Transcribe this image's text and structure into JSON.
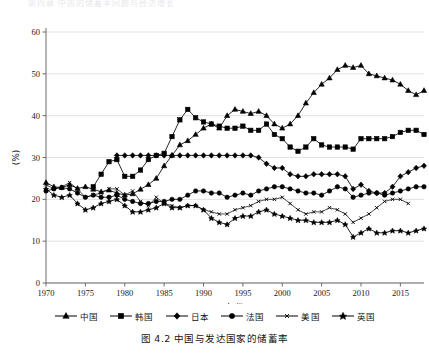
{
  "figure": {
    "cutoff_header": "第四章 中国的储蓄率问题与经济增长",
    "caption": "图 4.2  中国与发达国家的储蓄率"
  },
  "axes": {
    "y_label": "(%)",
    "x_label": "年份",
    "y_ticks": [
      0,
      10,
      20,
      30,
      40,
      50,
      60
    ],
    "y_tick_labels": [
      "0",
      "10",
      "20",
      "30",
      "40",
      "50",
      "60"
    ],
    "x_ticks": [
      1970,
      1975,
      1980,
      1985,
      1990,
      1995,
      2000,
      2005,
      2010,
      2015
    ],
    "x_tick_labels": [
      "1970",
      "1975",
      "1980",
      "1985",
      "1990",
      "1995",
      "2000",
      "2005",
      "2010",
      "2015"
    ]
  },
  "legend": {
    "position": "bottom",
    "items": [
      {
        "label": "中国",
        "marker": "triangle",
        "color": "#000000"
      },
      {
        "label": "韩国",
        "marker": "square",
        "color": "#000000"
      },
      {
        "label": "日本",
        "marker": "diamond",
        "color": "#000000"
      },
      {
        "label": "法国",
        "marker": "circle",
        "color": "#000000"
      },
      {
        "label": "美国",
        "marker": "cross",
        "color": "#000000"
      },
      {
        "label": "英国",
        "marker": "star",
        "color": "#000000"
      }
    ]
  },
  "chart_data": {
    "type": "line",
    "title": "图 4.2  中国与发达国家的储蓄率",
    "xlabel": "年份",
    "ylabel": "(%)",
    "xlim": [
      1970,
      2018
    ],
    "ylim": [
      0,
      60
    ],
    "grid": true,
    "legend_position": "bottom",
    "series": [
      {
        "name": "中国",
        "marker": "triangle",
        "x": [
          1970,
          1971,
          1972,
          1973,
          1974,
          1975,
          1976,
          1977,
          1978,
          1979,
          1980,
          1981,
          1982,
          1983,
          1984,
          1985,
          1986,
          1987,
          1988,
          1989,
          1990,
          1991,
          1992,
          1993,
          1994,
          1995,
          1996,
          1997,
          1998,
          1999,
          2000,
          2001,
          2002,
          2003,
          2004,
          2005,
          2006,
          2007,
          2008,
          2009,
          2010,
          2011,
          2012,
          2013,
          2014,
          2015,
          2016,
          2017,
          2018
        ],
        "y": [
          24.0,
          23.0,
          22.8,
          23.5,
          22.6,
          23.0,
          22.4,
          21.8,
          22.2,
          21.5,
          21.0,
          21.3,
          22.4,
          23.5,
          25.0,
          28.0,
          30.5,
          33.0,
          34.0,
          35.5,
          37.0,
          38.0,
          37.0,
          40.0,
          41.5,
          41.0,
          40.5,
          41.0,
          40.0,
          38.0,
          37.0,
          38.0,
          40.0,
          43.0,
          45.5,
          47.5,
          49.0,
          51.0,
          52.0,
          51.5,
          52.0,
          50.0,
          49.5,
          49.0,
          48.5,
          47.5,
          46.0,
          45.0,
          46.0
        ]
      },
      {
        "name": "韩国",
        "marker": "square",
        "x": [
          1976,
          1977,
          1978,
          1979,
          1980,
          1981,
          1982,
          1983,
          1984,
          1985,
          1986,
          1987,
          1988,
          1989,
          1990,
          1991,
          1992,
          1993,
          1994,
          1995,
          1996,
          1997,
          1998,
          1999,
          2000,
          2001,
          2002,
          2003,
          2004,
          2005,
          2006,
          2007,
          2008,
          2009,
          2010,
          2011,
          2012,
          2013,
          2014,
          2015,
          2016,
          2017,
          2018
        ],
        "y": [
          23.0,
          26.0,
          29.0,
          29.5,
          25.5,
          25.5,
          27.0,
          29.5,
          30.5,
          31.0,
          35.0,
          39.0,
          41.5,
          39.5,
          38.5,
          38.0,
          37.5,
          37.0,
          37.0,
          37.5,
          36.5,
          36.5,
          38.0,
          35.5,
          34.5,
          32.5,
          31.5,
          32.5,
          34.5,
          33.0,
          32.5,
          32.5,
          32.5,
          32.0,
          34.5,
          34.5,
          34.5,
          34.5,
          35.0,
          36.0,
          36.5,
          36.5,
          35.5
        ]
      },
      {
        "name": "日本",
        "marker": "diamond",
        "x": [
          1979,
          1980,
          1981,
          1982,
          1983,
          1984,
          1985,
          1986,
          1987,
          1988,
          1989,
          1990,
          1991,
          1992,
          1993,
          1994,
          1995,
          1996,
          1997,
          1998,
          1999,
          2000,
          2001,
          2002,
          2003,
          2004,
          2005,
          2006,
          2007,
          2008,
          2009,
          2010,
          2011,
          2012,
          2013,
          2014,
          2015,
          2016,
          2017,
          2018
        ],
        "y": [
          30.5,
          30.5,
          30.5,
          30.5,
          30.5,
          30.5,
          30.5,
          30.5,
          30.5,
          30.5,
          30.5,
          30.5,
          30.5,
          30.5,
          30.5,
          30.5,
          30.5,
          30.5,
          30.0,
          28.5,
          27.5,
          27.5,
          26.0,
          25.5,
          25.5,
          26.0,
          26.0,
          26.0,
          26.0,
          25.5,
          22.5,
          23.5,
          22.0,
          21.5,
          21.5,
          23.0,
          25.5,
          26.5,
          27.5,
          28.0
        ]
      },
      {
        "name": "法国",
        "marker": "circle",
        "x": [
          1970,
          1971,
          1972,
          1973,
          1974,
          1975,
          1976,
          1977,
          1978,
          1979,
          1980,
          1981,
          1982,
          1983,
          1984,
          1985,
          1986,
          1987,
          1988,
          1989,
          1990,
          1991,
          1992,
          1993,
          1994,
          1995,
          1996,
          1997,
          1998,
          1999,
          2000,
          2001,
          2002,
          2003,
          2004,
          2005,
          2006,
          2007,
          2008,
          2009,
          2010,
          2011,
          2012,
          2013,
          2014,
          2015,
          2016,
          2017,
          2018
        ],
        "y": [
          22.0,
          22.5,
          22.8,
          22.5,
          21.5,
          20.5,
          21.0,
          20.5,
          20.5,
          21.0,
          20.0,
          19.5,
          19.0,
          19.0,
          19.5,
          19.5,
          20.0,
          20.0,
          21.0,
          22.0,
          22.0,
          21.5,
          21.5,
          20.5,
          21.0,
          21.5,
          21.0,
          22.0,
          22.5,
          23.0,
          23.0,
          22.5,
          22.0,
          21.5,
          21.5,
          21.0,
          22.0,
          23.0,
          22.5,
          20.5,
          21.0,
          21.5,
          21.5,
          21.0,
          21.5,
          22.0,
          22.5,
          23.0,
          23.0
        ]
      },
      {
        "name": "美国",
        "marker": "cross",
        "x": [
          1970,
          1971,
          1972,
          1973,
          1974,
          1975,
          1976,
          1977,
          1978,
          1979,
          1980,
          1981,
          1982,
          1983,
          1984,
          1985,
          1986,
          1987,
          1988,
          1989,
          1990,
          1991,
          1992,
          1993,
          1994,
          1995,
          1996,
          1997,
          1998,
          1999,
          2000,
          2001,
          2002,
          2003,
          2004,
          2005,
          2006,
          2007,
          2008,
          2009,
          2010,
          2011,
          2012,
          2013,
          2014,
          2015,
          2016
        ],
        "y": [
          23.5,
          22.5,
          23.0,
          24.0,
          22.5,
          20.5,
          21.0,
          21.5,
          22.5,
          22.5,
          21.0,
          22.0,
          19.5,
          18.5,
          20.5,
          19.0,
          18.5,
          18.0,
          18.5,
          18.5,
          17.5,
          17.0,
          16.5,
          16.5,
          17.5,
          18.0,
          18.5,
          19.5,
          20.0,
          20.0,
          20.5,
          19.0,
          17.5,
          16.5,
          17.0,
          17.0,
          18.0,
          17.5,
          16.5,
          14.5,
          15.5,
          16.5,
          18.0,
          19.5,
          20.0,
          20.0,
          19.0
        ]
      },
      {
        "name": "英国",
        "marker": "star",
        "x": [
          1970,
          1971,
          1972,
          1973,
          1974,
          1975,
          1976,
          1977,
          1978,
          1979,
          1980,
          1981,
          1982,
          1983,
          1984,
          1985,
          1986,
          1987,
          1988,
          1989,
          1990,
          1991,
          1992,
          1993,
          1994,
          1995,
          1996,
          1997,
          1998,
          1999,
          2000,
          2001,
          2002,
          2003,
          2004,
          2005,
          2006,
          2007,
          2008,
          2009,
          2010,
          2011,
          2012,
          2013,
          2014,
          2015,
          2016,
          2017,
          2018
        ],
        "y": [
          22.5,
          21.0,
          20.5,
          21.0,
          19.0,
          17.5,
          18.0,
          19.0,
          19.5,
          20.0,
          18.5,
          17.0,
          17.0,
          17.5,
          18.0,
          19.0,
          18.0,
          18.0,
          18.5,
          18.5,
          17.5,
          15.5,
          14.5,
          14.0,
          15.5,
          16.0,
          16.0,
          17.0,
          17.5,
          16.5,
          16.0,
          15.5,
          15.0,
          15.0,
          14.5,
          14.5,
          14.5,
          15.0,
          14.0,
          11.0,
          12.0,
          13.0,
          12.0,
          12.0,
          12.5,
          12.5,
          12.0,
          12.5,
          13.0
        ]
      }
    ]
  }
}
